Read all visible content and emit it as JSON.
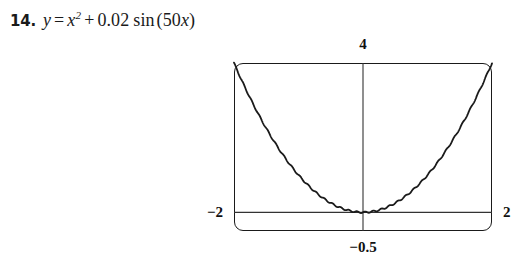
{
  "problem": {
    "number": "14.",
    "equation_plain": "y = x^2 + 0.02 sin (50x)",
    "equation_parts": {
      "lhs": "y",
      "equals": "=",
      "var": "x",
      "exponent": "2",
      "plus": "+",
      "coefficient": "0.02",
      "function": "sin",
      "open_paren": "(",
      "inner_coefficient": "50",
      "inner_var": "x",
      "close_paren": ")"
    }
  },
  "graph": {
    "window_labels": {
      "ymax": "4",
      "xmin": "−2",
      "xmax": "2",
      "ymin": "−0.5"
    },
    "colors": {
      "ink": "#1a1a1a",
      "background": "#ffffff",
      "axis": "#333333"
    }
  },
  "chart_data": {
    "type": "line",
    "title": "",
    "xlabel": "",
    "ylabel": "",
    "xlim": [
      -2,
      2
    ],
    "ylim": [
      -0.5,
      4
    ],
    "grid": false,
    "legend": null,
    "axes": {
      "x_axis_at_y": 0,
      "y_axis_at_x": 0,
      "frame": "calculator-viewport"
    },
    "function": "y = x^2 + 0.02*sin(50*x)",
    "series": [
      {
        "name": "y = x^2 + 0.02 sin(50x)",
        "x": [
          -2,
          -1.9,
          -1.8,
          -1.7,
          -1.6,
          -1.5,
          -1.4,
          -1.3,
          -1.2,
          -1.1,
          -1,
          -0.9,
          -0.8,
          -0.7,
          -0.6,
          -0.5,
          -0.4,
          -0.3,
          -0.2,
          -0.1,
          0,
          0.1,
          0.2,
          0.3,
          0.4,
          0.5,
          0.6,
          0.7,
          0.8,
          0.9,
          1,
          1.1,
          1.2,
          1.3,
          1.4,
          1.5,
          1.6,
          1.7,
          1.8,
          1.9,
          2
        ],
        "values": [
          4.011,
          3.601,
          3.245,
          2.894,
          2.554,
          2.243,
          1.969,
          1.681,
          1.455,
          1.2,
          0.983,
          0.823,
          0.632,
          0.506,
          0.357,
          0.245,
          0.166,
          0.092,
          0.038,
          0.008,
          0.0,
          0.012,
          0.042,
          0.088,
          0.174,
          0.255,
          0.343,
          0.494,
          0.648,
          0.817,
          0.983,
          1.22,
          1.465,
          1.699,
          1.971,
          2.257,
          2.566,
          2.894,
          3.235,
          3.599,
          3.989
        ]
      }
    ],
    "annotations": [
      {
        "text": "4",
        "position": "above-top-center",
        "meaning": "y window maximum"
      },
      {
        "text": "-2",
        "position": "left-of-x-axis",
        "meaning": "x window minimum"
      },
      {
        "text": "2",
        "position": "right-of-x-axis",
        "meaning": "x window maximum"
      },
      {
        "text": "-0.5",
        "position": "below-bottom-center",
        "meaning": "y window minimum"
      }
    ]
  }
}
